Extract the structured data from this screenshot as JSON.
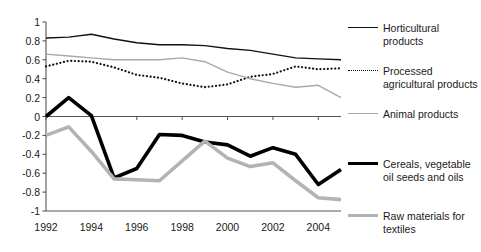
{
  "chart_data": {
    "type": "line",
    "title": "",
    "subtitle": "",
    "xlabel": "",
    "ylabel": "",
    "xlim": [
      1992,
      2005
    ],
    "ylim": [
      -1,
      1
    ],
    "grid": false,
    "legend_position": "right",
    "x": [
      1992,
      1993,
      1994,
      1995,
      1996,
      1997,
      1998,
      1999,
      2000,
      2001,
      2002,
      2003,
      2004,
      2005
    ],
    "xtick_labels": [
      "1992",
      "1994",
      "1996",
      "1998",
      "2000",
      "2002",
      "2004"
    ],
    "xticks": [
      1992,
      1994,
      1996,
      1998,
      2000,
      2002,
      2004
    ],
    "ytick_labels": [
      "1",
      "0.8",
      "0.6",
      "0.4",
      "0.2",
      "0",
      "-0.2",
      "-0.4",
      "-0.6",
      "-0.8",
      "-1"
    ],
    "yticks": [
      1,
      0.8,
      0.6,
      0.4,
      0.2,
      0,
      -0.2,
      -0.4,
      -0.6,
      -0.8,
      -1
    ],
    "series": [
      {
        "name": "Horticultural products",
        "style": "solid-thin-black",
        "color": "#111111",
        "values": [
          0.83,
          0.84,
          0.87,
          0.82,
          0.78,
          0.76,
          0.76,
          0.75,
          0.72,
          0.7,
          0.66,
          0.62,
          0.61,
          0.6
        ]
      },
      {
        "name": "Processed agricultural products",
        "style": "dotted-black",
        "color": "#111111",
        "values": [
          0.53,
          0.59,
          0.58,
          0.52,
          0.44,
          0.41,
          0.35,
          0.31,
          0.34,
          0.42,
          0.45,
          0.53,
          0.5,
          0.51
        ]
      },
      {
        "name": "Animal products",
        "style": "solid-thin-grey",
        "color": "#a8a8a8",
        "values": [
          0.66,
          0.64,
          0.62,
          0.6,
          0.6,
          0.6,
          0.62,
          0.58,
          0.47,
          0.4,
          0.35,
          0.31,
          0.33,
          0.2
        ]
      },
      {
        "name": "Cereals, vegetable oil seeds and oils",
        "style": "solid-thick-black",
        "color": "#000000",
        "values": [
          0.0,
          0.2,
          0.01,
          -0.65,
          -0.55,
          -0.19,
          -0.2,
          -0.27,
          -0.3,
          -0.42,
          -0.33,
          -0.4,
          -0.72,
          -0.56
        ]
      },
      {
        "name": "Raw materials for textiles",
        "style": "solid-thick-grey",
        "color": "#b3b3b3",
        "values": [
          -0.2,
          -0.11,
          -0.37,
          -0.66,
          -0.67,
          -0.68,
          -0.47,
          -0.26,
          -0.44,
          -0.53,
          -0.49,
          -0.68,
          -0.86,
          -0.88
        ]
      }
    ]
  },
  "legend": {
    "entries": [
      {
        "label": "Horticultural products",
        "swatch": "solid-thin-black"
      },
      {
        "label": "Processed agricultural products",
        "swatch": "dotted-black"
      },
      {
        "label": "Animal products",
        "swatch": "solid-thin-grey"
      },
      {
        "label": "Cereals, vegetable oil seeds and oils",
        "swatch": "solid-thick-black"
      },
      {
        "label": "Raw materials for textiles",
        "swatch": "solid-thick-grey"
      }
    ]
  }
}
